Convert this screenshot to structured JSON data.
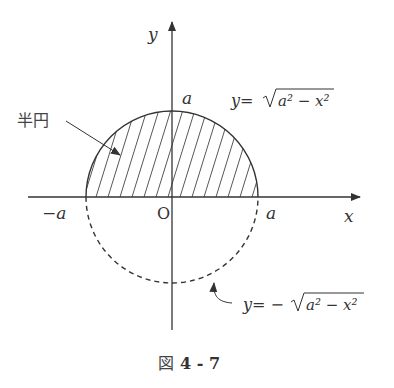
{
  "figure": {
    "caption_prefix": "図",
    "caption_number": "4 - 7",
    "axes": {
      "x_label": "x",
      "y_label": "y",
      "origin_label": "O"
    },
    "tick_labels": {
      "neg_a": "−a",
      "pos_a": "a",
      "top_a": "a"
    },
    "annotations": {
      "semicircle_label": "半円",
      "upper_eq_lhs": "y=",
      "upper_eq_radicand": "a² − x²",
      "lower_eq_lhs": "y= −",
      "lower_eq_radicand": "a² − x²"
    },
    "geometry": {
      "center_x": 172,
      "center_y": 197,
      "radius": 86,
      "upper_half": "solid, hatched",
      "lower_half": "dashed"
    },
    "colors": {
      "line": "#333333",
      "background": "#ffffff"
    }
  }
}
